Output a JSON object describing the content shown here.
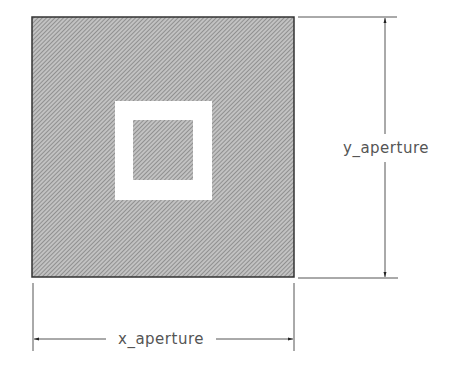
{
  "diagram": {
    "type": "aperture-dimension-drawing",
    "outer_rect": {
      "x": 32,
      "y": 17,
      "width": 262,
      "height": 260,
      "fill": "hatched-gray"
    },
    "white_frame": {
      "x": 115,
      "y": 101,
      "width": 97,
      "height": 99
    },
    "inner_rect": {
      "x": 133,
      "y": 120,
      "width": 60,
      "height": 60
    },
    "labels": {
      "x_dimension": "x_aperture",
      "y_dimension": "y_aperture"
    },
    "colors": {
      "hatch_dark": "#7a7a7a",
      "hatch_light": "#c4c4c4",
      "outline": "#333333",
      "dimension_line": "#555555",
      "text": "#555555"
    }
  }
}
